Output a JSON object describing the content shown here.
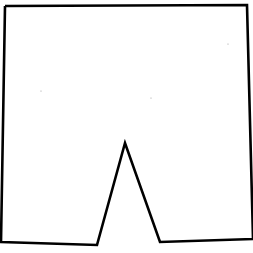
{
  "canvas": {
    "width": 253,
    "height": 253,
    "background": "#ffffff"
  },
  "shape": {
    "description": "shorts-like outline with triangular notch at bottom",
    "stroke_color": "#000000",
    "points": [
      [
        5,
        6
      ],
      [
        247,
        5
      ],
      [
        253,
        239
      ],
      [
        160,
        242
      ],
      [
        125,
        143
      ],
      [
        97,
        245
      ],
      [
        1,
        242
      ],
      [
        5,
        6
      ]
    ]
  },
  "specks": [
    [
      41,
      91
    ],
    [
      151,
      98
    ],
    [
      228,
      44
    ]
  ]
}
